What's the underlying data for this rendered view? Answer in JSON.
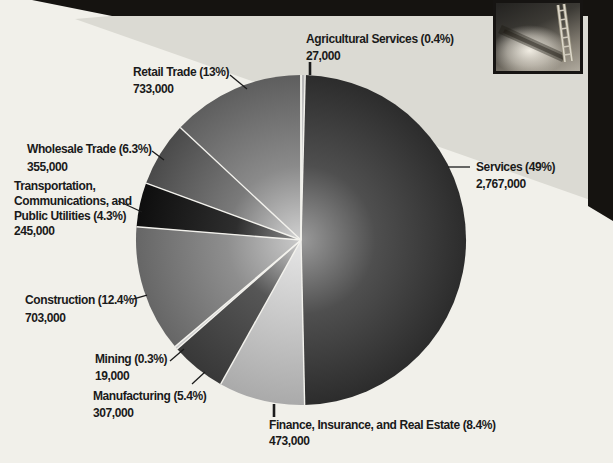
{
  "palette": {
    "page_cream": "#f1f0ea",
    "panel_gray": "#dbdad3",
    "band_black": "#151310",
    "text_color": "#1a1a1a",
    "separator_white": "#f3f2ed"
  },
  "chart_data": {
    "type": "pie",
    "title": "",
    "direction": "clockwise",
    "start_angle_deg": 0,
    "categories": [
      "Agricultural Services",
      "Services",
      "Finance, Insurance, and Real Estate",
      "Manufacturing",
      "Mining",
      "Construction",
      "Transportation, Communications, and Public Utilities",
      "Wholesale Trade",
      "Retail Trade"
    ],
    "values": [
      27000,
      2767000,
      473000,
      307000,
      19000,
      703000,
      245000,
      355000,
      733000
    ],
    "slices": [
      {
        "label": "Agricultural Services",
        "pct": 0.4,
        "value": 27000,
        "callout": [
          "Agricultural Services (0.4%)",
          "27,000"
        ],
        "stops": [
          [
            0,
            "#eaeaea"
          ],
          [
            1,
            "#b5b5b5"
          ]
        ]
      },
      {
        "label": "Services",
        "pct": 49,
        "value": 2767000,
        "callout": [
          "Services (49%)",
          "2,767,000"
        ],
        "stops": [
          [
            0,
            "#9a9a9a"
          ],
          [
            0.45,
            "#4f4f4f"
          ],
          [
            1,
            "#2c2c2c"
          ]
        ]
      },
      {
        "label": "Finance, Insurance, and Real Estate",
        "pct": 8.4,
        "value": 473000,
        "callout": [
          "Finance, Insurance, and Real Estate (8.4%)",
          "473,000"
        ],
        "stops": [
          [
            0,
            "#e6e6e6"
          ],
          [
            1,
            "#aaaaaa"
          ]
        ]
      },
      {
        "label": "Manufacturing",
        "pct": 5.4,
        "value": 307000,
        "callout": [
          "Manufacturing (5.4%)",
          "307,000"
        ],
        "stops": [
          [
            0,
            "#cfcfcf"
          ],
          [
            0.4,
            "#565656"
          ],
          [
            1,
            "#383838"
          ]
        ]
      },
      {
        "label": "Mining",
        "pct": 0.3,
        "value": 19000,
        "callout": [
          "Mining (0.3%)",
          "19,000"
        ],
        "stops": [
          [
            0,
            "#ececec"
          ],
          [
            1,
            "#c8c8c8"
          ]
        ]
      },
      {
        "label": "Construction",
        "pct": 12.4,
        "value": 703000,
        "callout": [
          "Construction (12.4%)",
          "703,000"
        ],
        "stops": [
          [
            0,
            "#cacaca"
          ],
          [
            0.45,
            "#8e8e8e"
          ],
          [
            1,
            "#666666"
          ]
        ]
      },
      {
        "label": "Transportation, Communications, and Public Utilities",
        "pct": 4.3,
        "value": 245000,
        "callout": [
          "Transportation,",
          "Communications, and",
          "Public Utilities (4.3%)",
          "245,000"
        ],
        "stops": [
          [
            0,
            "#8f8f8f"
          ],
          [
            0.4,
            "#2e2e2e"
          ],
          [
            1,
            "#0e0e0e"
          ]
        ]
      },
      {
        "label": "Wholesale Trade",
        "pct": 6.3,
        "value": 355000,
        "callout": [
          "Wholesale Trade (6.3%)",
          "355,000"
        ],
        "stops": [
          [
            0,
            "#d6d6d6"
          ],
          [
            0.45,
            "#7a7a7a"
          ],
          [
            1,
            "#4a4a4a"
          ]
        ]
      },
      {
        "label": "Retail Trade",
        "pct": 13,
        "value": 733000,
        "callout": [
          "Retail Trade (13%)",
          "733,000"
        ],
        "stops": [
          [
            0,
            "#d0d0d0"
          ],
          [
            0.45,
            "#8a8a8a"
          ],
          [
            1,
            "#5e5e5e"
          ]
        ]
      }
    ]
  }
}
